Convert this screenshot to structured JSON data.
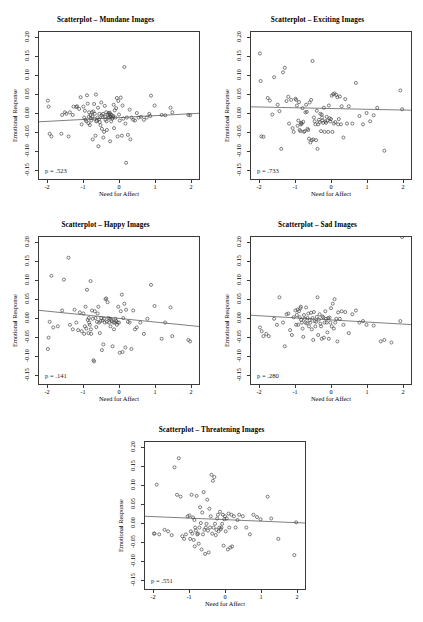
{
  "figure": {
    "axis_labels": {
      "x": "Need for Affect",
      "y": "Emotional Response"
    },
    "y_ticks": [
      "-0.15",
      "-0.10",
      "-0.05",
      "0.00",
      "0.05",
      "0.10",
      "0.15",
      "0.20"
    ],
    "x_ticks": [
      "-2",
      "-1",
      "0",
      "1",
      "2"
    ],
    "point_color": "#3a3a3a",
    "line_color": "#707070",
    "axis_color": "#3a3a3a"
  },
  "chart_data": [
    {
      "type": "scatter",
      "title": "Scatterplot – Mundane Images",
      "xlabel": "Need for Affect",
      "ylabel": "Emotional Response",
      "xlim": [
        -2.25,
        2.25
      ],
      "ylim": [
        -0.175,
        0.215
      ],
      "grid": false,
      "legend": "none",
      "annotation": "p = .523",
      "fit_line": {
        "intercept": -0.012,
        "slope": 0.005
      },
      "x": [
        -2.0,
        -1.98,
        -1.95,
        -1.9,
        -1.62,
        -1.6,
        -1.52,
        -1.48,
        -1.42,
        -1.38,
        -1.3,
        -1.28,
        -1.2,
        -1.18,
        -1.12,
        -1.08,
        -1.05,
        -1.0,
        -0.98,
        -0.96,
        -0.94,
        -0.92,
        -0.9,
        -0.88,
        -0.86,
        -0.85,
        -0.84,
        -0.82,
        -0.8,
        -0.79,
        -0.78,
        -0.76,
        -0.75,
        -0.74,
        -0.72,
        -0.7,
        -0.69,
        -0.68,
        -0.66,
        -0.65,
        -0.64,
        -0.62,
        -0.6,
        -0.59,
        -0.58,
        -0.56,
        -0.55,
        -0.54,
        -0.52,
        -0.5,
        -0.49,
        -0.48,
        -0.46,
        -0.45,
        -0.44,
        -0.42,
        -0.4,
        -0.39,
        -0.38,
        -0.36,
        -0.35,
        -0.34,
        -0.32,
        -0.3,
        -0.29,
        -0.28,
        -0.27,
        -0.26,
        -0.25,
        -0.24,
        -0.23,
        -0.22,
        -0.2,
        -0.19,
        -0.18,
        -0.16,
        -0.15,
        -0.14,
        -0.12,
        -0.1,
        -0.08,
        -0.06,
        -0.04,
        -0.02,
        0.0,
        0.02,
        0.05,
        0.08,
        0.1,
        0.12,
        0.15,
        0.18,
        0.2,
        0.22,
        0.25,
        0.3,
        0.32,
        0.35,
        0.4,
        0.45,
        0.5,
        0.55,
        0.62,
        0.7,
        0.78,
        0.85,
        0.88,
        0.9,
        1.0,
        1.2,
        1.3,
        1.45,
        1.5,
        1.95,
        2.0
      ],
      "y": [
        0.033,
        0.017,
        -0.055,
        -0.062,
        -0.055,
        -0.005,
        0.002,
        -0.002,
        -0.062,
        0.002,
        -0.005,
        0.017,
        0.016,
        0.018,
        0.011,
        0.042,
        -0.03,
        0.017,
        -0.012,
        0.006,
        -0.018,
        -0.022,
        0.047,
        0.025,
        -0.027,
        -0.01,
        0.002,
        -0.032,
        -0.006,
        -0.014,
        -0.02,
        0.002,
        -0.009,
        -0.07,
        0.004,
        0.024,
        -0.015,
        -0.002,
        -0.06,
        0.049,
        -0.022,
        -0.02,
        -0.012,
        0.014,
        -0.088,
        -0.016,
        -0.002,
        -0.024,
        -0.032,
        0.028,
        -0.006,
        -0.042,
        -0.01,
        -0.002,
        -0.065,
        -0.05,
        0.019,
        -0.01,
        -0.018,
        0.002,
        -0.022,
        -0.045,
        -0.004,
        -0.012,
        0.0,
        -0.012,
        -0.003,
        0.001,
        -0.075,
        -0.01,
        -0.004,
        -0.022,
        -0.006,
        -0.015,
        -0.012,
        -0.008,
        0.022,
        -0.04,
        0.007,
        -0.012,
        0.013,
        0.04,
        -0.062,
        0.032,
        -0.004,
        -0.02,
        0.041,
        -0.06,
        0.02,
        -0.015,
        0.122,
        -0.028,
        -0.132,
        -0.012,
        -0.058,
        0.009,
        -0.07,
        -0.012,
        -0.018,
        -0.02,
        0.0,
        -0.012,
        -0.01,
        -0.018,
        -0.012,
        -0.002,
        -0.008,
        0.046,
        0.02,
        -0.005,
        -0.006,
        0.014,
        0.002,
        -0.005,
        -0.006,
        -0.008
      ]
    },
    {
      "type": "scatter",
      "title": "Scatterplot – Exciting Images",
      "xlabel": "Need for Affect",
      "ylabel": "Emotional Response",
      "xlim": [
        -2.25,
        2.25
      ],
      "ylim": [
        -0.175,
        0.215
      ],
      "grid": false,
      "legend": "none",
      "annotation": "p = .733",
      "fit_line": {
        "intercept": 0.012,
        "slope": -0.002
      },
      "x": [
        -2.0,
        -1.98,
        -1.96,
        -1.9,
        -1.78,
        -1.72,
        -1.65,
        -1.6,
        -1.5,
        -1.45,
        -1.4,
        -1.35,
        -1.3,
        -1.25,
        -1.2,
        -1.18,
        -1.12,
        -1.08,
        -1.05,
        -1.0,
        -0.98,
        -0.96,
        -0.94,
        -0.92,
        -0.9,
        -0.88,
        -0.86,
        -0.85,
        -0.84,
        -0.82,
        -0.8,
        -0.78,
        -0.76,
        -0.74,
        -0.72,
        -0.7,
        -0.68,
        -0.66,
        -0.64,
        -0.62,
        -0.6,
        -0.58,
        -0.56,
        -0.54,
        -0.52,
        -0.5,
        -0.48,
        -0.46,
        -0.44,
        -0.42,
        -0.4,
        -0.38,
        -0.36,
        -0.34,
        -0.32,
        -0.3,
        -0.28,
        -0.26,
        -0.25,
        -0.24,
        -0.22,
        -0.2,
        -0.18,
        -0.16,
        -0.14,
        -0.12,
        -0.1,
        -0.08,
        -0.06,
        -0.04,
        -0.02,
        0.0,
        0.02,
        0.04,
        0.06,
        0.08,
        0.1,
        0.12,
        0.15,
        0.18,
        0.2,
        0.22,
        0.25,
        0.28,
        0.3,
        0.35,
        0.4,
        0.45,
        0.5,
        0.6,
        0.7,
        0.8,
        0.9,
        1.0,
        1.1,
        1.2,
        1.3,
        1.5,
        1.95,
        2.0
      ],
      "y": [
        0.158,
        0.085,
        -0.062,
        -0.063,
        0.04,
        0.033,
        -0.004,
        0.095,
        0.022,
        0.005,
        -0.095,
        0.108,
        0.12,
        0.032,
        0.043,
        -0.028,
        0.035,
        -0.04,
        -0.05,
        0.038,
        0.035,
        0.02,
        -0.034,
        -0.02,
        0.029,
        -0.045,
        -0.048,
        -0.03,
        -0.026,
        -0.028,
        0.013,
        -0.023,
        -0.05,
        -0.048,
        0.002,
        0.022,
        0.003,
        -0.042,
        -0.045,
        -0.068,
        0.028,
        -0.078,
        0.035,
        -0.072,
        0.138,
        -0.07,
        -0.012,
        -0.022,
        -0.03,
        -0.072,
        0.006,
        -0.095,
        -0.03,
        -0.018,
        -0.024,
        -0.002,
        -0.048,
        -0.004,
        -0.012,
        -0.02,
        -0.026,
        0.014,
        -0.05,
        -0.022,
        -0.026,
        -0.01,
        -0.02,
        -0.05,
        0.02,
        -0.014,
        -0.022,
        -0.016,
        0.046,
        -0.05,
        0.05,
        -0.028,
        0.052,
        -0.024,
        0.048,
        0.042,
        -0.03,
        -0.016,
        0.044,
        -0.03,
        0.018,
        -0.065,
        0.037,
        -0.028,
        0.018,
        -0.028,
        0.08,
        -0.008,
        -0.03,
        0.0,
        -0.022,
        -0.006,
        0.014,
        -0.1,
        0.06,
        0.01
      ]
    },
    {
      "type": "scatter",
      "title": "Scatterplot – Happy Images",
      "xlabel": "Need for Affect",
      "ylabel": "Emotional Response",
      "xlim": [
        -2.25,
        2.25
      ],
      "ylim": [
        -0.175,
        0.215
      ],
      "grid": false,
      "legend": "none",
      "annotation": "p = .141",
      "fit_line": {
        "intercept": -0.001,
        "slope": -0.0095
      },
      "x": [
        -2.0,
        -1.98,
        -1.95,
        -1.9,
        -1.85,
        -1.72,
        -1.6,
        -1.55,
        -1.42,
        -1.38,
        -1.3,
        -1.25,
        -1.2,
        -1.15,
        -1.1,
        -1.05,
        -1.0,
        -0.98,
        -0.96,
        -0.94,
        -0.92,
        -0.9,
        -0.88,
        -0.86,
        -0.85,
        -0.84,
        -0.82,
        -0.8,
        -0.79,
        -0.78,
        -0.76,
        -0.74,
        -0.72,
        -0.7,
        -0.68,
        -0.66,
        -0.64,
        -0.62,
        -0.6,
        -0.58,
        -0.56,
        -0.54,
        -0.52,
        -0.5,
        -0.48,
        -0.46,
        -0.44,
        -0.42,
        -0.4,
        -0.38,
        -0.36,
        -0.34,
        -0.32,
        -0.3,
        -0.28,
        -0.26,
        -0.24,
        -0.22,
        -0.2,
        -0.18,
        -0.16,
        -0.14,
        -0.12,
        -0.1,
        -0.08,
        -0.06,
        -0.04,
        -0.02,
        0.0,
        0.02,
        0.05,
        0.08,
        0.1,
        0.12,
        0.15,
        0.18,
        0.2,
        0.25,
        0.3,
        0.35,
        0.4,
        0.45,
        0.5,
        0.6,
        0.7,
        0.8,
        0.9,
        1.0,
        1.2,
        1.3,
        1.45,
        1.5,
        1.95,
        2.0
      ],
      "y": [
        -0.082,
        -0.052,
        -0.01,
        0.112,
        -0.025,
        -0.022,
        0.02,
        0.102,
        0.16,
        -0.018,
        -0.03,
        0.022,
        -0.012,
        -0.032,
        0.015,
        -0.035,
        0.012,
        -0.042,
        -0.022,
        0.03,
        -0.028,
        0.075,
        -0.005,
        -0.04,
        0.0,
        -0.012,
        -0.018,
        0.098,
        -0.03,
        -0.042,
        0.02,
        -0.002,
        -0.112,
        -0.115,
        0.018,
        0.0,
        -0.024,
        -0.01,
        0.012,
        0.03,
        -0.012,
        -0.04,
        -0.008,
        0.0,
        -0.085,
        -0.006,
        -0.07,
        -0.002,
        -0.012,
        0.05,
        0.052,
        -0.01,
        0.042,
        0.0,
        -0.012,
        -0.002,
        -0.022,
        -0.004,
        -0.008,
        -0.075,
        -0.012,
        -0.03,
        -0.012,
        -0.002,
        -0.008,
        -0.018,
        -0.012,
        0.03,
        -0.012,
        -0.092,
        0.018,
        0.062,
        -0.09,
        0.0,
        0.038,
        -0.078,
        0.022,
        -0.01,
        -0.012,
        -0.082,
        0.02,
        -0.03,
        -0.025,
        -0.012,
        -0.042,
        -0.002,
        0.088,
        0.032,
        -0.055,
        -0.012,
        0.028,
        -0.048,
        -0.058,
        -0.062
      ]
    },
    {
      "type": "scatter",
      "title": "Scatterplot – Sad Images",
      "xlabel": "Need for Affect",
      "ylabel": "Emotional Response",
      "xlim": [
        -2.25,
        2.25
      ],
      "ylim": [
        -0.175,
        0.215
      ],
      "grid": false,
      "legend": "none",
      "annotation": "p = .280",
      "fit_line": {
        "intercept": -0.005,
        "slope": -0.0055
      },
      "x": [
        -2.0,
        -1.95,
        -1.9,
        -1.82,
        -1.75,
        -1.6,
        -1.52,
        -1.45,
        -1.35,
        -1.3,
        -1.25,
        -1.2,
        -1.15,
        -1.1,
        -1.05,
        -1.0,
        -0.98,
        -0.96,
        -0.94,
        -0.92,
        -0.9,
        -0.88,
        -0.86,
        -0.85,
        -0.84,
        -0.82,
        -0.8,
        -0.78,
        -0.76,
        -0.74,
        -0.72,
        -0.7,
        -0.68,
        -0.66,
        -0.64,
        -0.62,
        -0.6,
        -0.58,
        -0.56,
        -0.54,
        -0.52,
        -0.5,
        -0.48,
        -0.46,
        -0.44,
        -0.42,
        -0.4,
        -0.38,
        -0.36,
        -0.34,
        -0.32,
        -0.3,
        -0.28,
        -0.26,
        -0.24,
        -0.22,
        -0.2,
        -0.18,
        -0.16,
        -0.14,
        -0.12,
        -0.1,
        -0.08,
        -0.06,
        -0.04,
        -0.02,
        0.0,
        0.02,
        0.05,
        0.08,
        0.1,
        0.12,
        0.15,
        0.18,
        0.2,
        0.25,
        0.3,
        0.35,
        0.4,
        0.5,
        0.6,
        0.7,
        0.8,
        0.9,
        1.0,
        1.2,
        1.4,
        1.5,
        1.7,
        1.95,
        2.0
      ],
      "y": [
        -0.025,
        -0.035,
        -0.048,
        -0.042,
        -0.048,
        -0.002,
        -0.018,
        0.055,
        -0.012,
        -0.075,
        0.01,
        0.012,
        -0.032,
        -0.045,
        0.002,
        0.02,
        -0.018,
        0.008,
        0.022,
        -0.018,
        0.018,
        0.002,
        0.026,
        0.03,
        -0.005,
        -0.012,
        -0.028,
        -0.05,
        0.008,
        -0.002,
        -0.012,
        0.028,
        -0.014,
        0.0,
        0.012,
        -0.022,
        -0.006,
        -0.012,
        0.014,
        -0.03,
        0.0,
        -0.058,
        0.016,
        -0.008,
        -0.022,
        -0.01,
        0.003,
        0.055,
        -0.045,
        -0.004,
        0.01,
        -0.015,
        -0.022,
        -0.055,
        0.004,
        0.002,
        -0.052,
        -0.012,
        0.018,
        -0.002,
        -0.012,
        -0.038,
        0.0,
        -0.055,
        0.001,
        -0.012,
        0.026,
        -0.022,
        0.038,
        -0.028,
        0.05,
        -0.012,
        -0.002,
        -0.062,
        0.015,
        -0.002,
        0.018,
        -0.018,
        0.016,
        -0.04,
        0.01,
        0.02,
        -0.012,
        -0.008,
        -0.018,
        -0.02,
        -0.062,
        -0.058,
        -0.065,
        -0.008
      ]
    },
    {
      "type": "scatter",
      "title": "Scatterplot – Threatening Images",
      "xlabel": "Need for Affect",
      "ylabel": "Emotional Response",
      "xlim": [
        -2.25,
        2.25
      ],
      "ylim": [
        -0.175,
        0.215
      ],
      "grid": false,
      "legend": "none",
      "annotation": "p = .551",
      "fit_line": {
        "intercept": 0.009,
        "slope": -0.004
      },
      "x": [
        -2.0,
        -1.98,
        -1.92,
        -1.85,
        -1.7,
        -1.6,
        -1.5,
        -1.42,
        -1.35,
        -1.3,
        -1.25,
        -1.2,
        -1.15,
        -1.1,
        -1.05,
        -1.0,
        -0.98,
        -0.96,
        -0.94,
        -0.92,
        -0.9,
        -0.88,
        -0.86,
        -0.85,
        -0.84,
        -0.82,
        -0.8,
        -0.78,
        -0.76,
        -0.74,
        -0.72,
        -0.7,
        -0.68,
        -0.66,
        -0.64,
        -0.62,
        -0.6,
        -0.58,
        -0.56,
        -0.54,
        -0.52,
        -0.5,
        -0.48,
        -0.46,
        -0.44,
        -0.42,
        -0.4,
        -0.38,
        -0.36,
        -0.34,
        -0.32,
        -0.3,
        -0.28,
        -0.26,
        -0.24,
        -0.22,
        -0.2,
        -0.18,
        -0.16,
        -0.14,
        -0.12,
        -0.1,
        -0.08,
        -0.06,
        -0.04,
        -0.02,
        0.0,
        0.02,
        0.05,
        0.08,
        0.1,
        0.12,
        0.15,
        0.18,
        0.2,
        0.25,
        0.3,
        0.35,
        0.4,
        0.5,
        0.6,
        0.7,
        0.8,
        0.9,
        1.0,
        1.2,
        1.3,
        1.5,
        1.95,
        2.0
      ],
      "y": [
        -0.028,
        -0.028,
        0.102,
        -0.03,
        -0.018,
        -0.022,
        -0.032,
        0.148,
        0.075,
        0.172,
        0.07,
        -0.035,
        -0.042,
        -0.03,
        0.018,
        0.02,
        -0.042,
        -0.022,
        0.075,
        -0.028,
        0.015,
        -0.045,
        0.008,
        -0.062,
        -0.012,
        -0.02,
        0.072,
        -0.03,
        -0.028,
        -0.055,
        -0.012,
        0.042,
        0.0,
        -0.07,
        0.028,
        -0.03,
        0.082,
        -0.018,
        -0.082,
        -0.012,
        -0.002,
        0.062,
        -0.02,
        -0.078,
        0.038,
        -0.012,
        0.018,
        0.128,
        -0.028,
        0.112,
        -0.012,
        0.122,
        -0.002,
        -0.032,
        -0.018,
        0.012,
        0.022,
        -0.022,
        -0.012,
        0.03,
        -0.016,
        -0.012,
        -0.002,
        0.022,
        -0.06,
        0.01,
        0.018,
        -0.022,
        0.012,
        -0.07,
        0.025,
        -0.012,
        -0.065,
        0.022,
        -0.062,
        0.018,
        -0.012,
        0.008,
        0.022,
        0.018,
        -0.012,
        -0.03,
        0.022,
        0.016,
        0.01,
        0.07,
        0.012,
        -0.042,
        -0.085,
        0.002
      ]
    }
  ]
}
